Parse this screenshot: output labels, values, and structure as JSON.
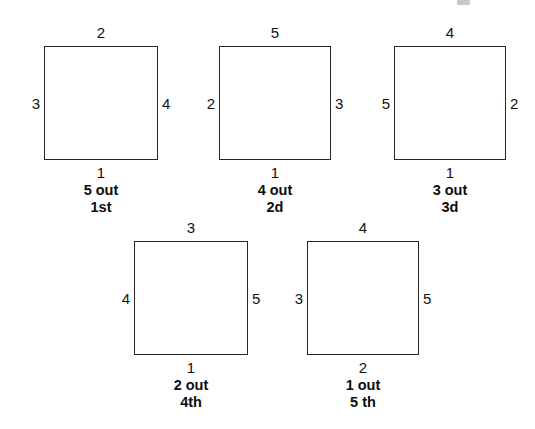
{
  "page": {
    "background_color": "#ffffff",
    "line_color": "#262626",
    "text_color": "#111111",
    "width": 535,
    "height": 429
  },
  "artifact": {
    "name": "cut-off-text-fragment",
    "description": "partial glyph clipped at top edge"
  },
  "diagrams": [
    {
      "id": "square-1",
      "x": 44,
      "y": 46,
      "w": 114,
      "h": 114,
      "top": "2",
      "left": "3",
      "right": "4",
      "bottom": "1",
      "caption_line1": "5 out",
      "caption_line2": "1st"
    },
    {
      "id": "square-2",
      "x": 219,
      "y": 46,
      "w": 112,
      "h": 114,
      "top": "5",
      "left": "2",
      "right": "3",
      "bottom": "1",
      "caption_line1": "4 out",
      "caption_line2": "2d"
    },
    {
      "id": "square-3",
      "x": 394,
      "y": 46,
      "w": 112,
      "h": 114,
      "top": "4",
      "left": "5",
      "right": "2",
      "bottom": "1",
      "caption_line1": "3 out",
      "caption_line2": "3d"
    },
    {
      "id": "square-4",
      "x": 134,
      "y": 241,
      "w": 114,
      "h": 114,
      "top": "3",
      "left": "4",
      "right": "5",
      "bottom": "1",
      "caption_line1": "2 out",
      "caption_line2": "4th"
    },
    {
      "id": "square-5",
      "x": 307,
      "y": 241,
      "w": 112,
      "h": 114,
      "top": "4",
      "left": "3",
      "right": "5",
      "bottom": "2",
      "caption_line1": "1 out",
      "caption_line2": "5 th"
    }
  ]
}
